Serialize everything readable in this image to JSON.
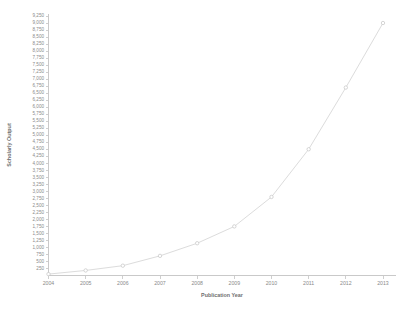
{
  "chart_data": {
    "type": "line",
    "title": "",
    "xlabel": "Publication Year",
    "ylabel": "Scholarly Output",
    "x": [
      2004,
      2005,
      2006,
      2007,
      2008,
      2009,
      2010,
      2011,
      2012,
      2013
    ],
    "categories": [
      "2004",
      "2005",
      "2006",
      "2007",
      "2008",
      "2009",
      "2010",
      "2011",
      "2012",
      "2013"
    ],
    "values": [
      50,
      180,
      350,
      700,
      1150,
      1750,
      2800,
      4500,
      6700,
      9000
    ],
    "series": [
      {
        "name": "Scholarly Output",
        "values": [
          50,
          180,
          350,
          700,
          1150,
          1750,
          2800,
          4500,
          6700,
          9000
        ]
      }
    ],
    "xlim": [
      2004,
      2013
    ],
    "ylim": [
      0,
      9250
    ],
    "ytick_step": 250,
    "grid": false,
    "legend": false,
    "marker": "circle",
    "line_color": "#dcdcdc",
    "marker_color": "#c4c4c4",
    "axis_color": "#c9c9c9",
    "label_color": "#8a8a8a",
    "yticks": [
      "9,250",
      "9,000",
      "8,750",
      "8,500",
      "8,250",
      "8,000",
      "7,750",
      "7,500",
      "7,250",
      "7,000",
      "6,750",
      "6,500",
      "6,250",
      "6,000",
      "5,750",
      "5,500",
      "5,250",
      "5,000",
      "4,750",
      "4,500",
      "4,250",
      "4,000",
      "3,750",
      "3,500",
      "3,250",
      "3,000",
      "2,750",
      "2,500",
      "2,250",
      "2,000",
      "1,750",
      "1,500",
      "1,250",
      "1,000",
      "750",
      "500",
      "250"
    ],
    "ytick_values": [
      9250,
      9000,
      8750,
      8500,
      8250,
      8000,
      7750,
      7500,
      7250,
      7000,
      6750,
      6500,
      6250,
      6000,
      5750,
      5500,
      5250,
      5000,
      4750,
      4500,
      4250,
      4000,
      3750,
      3500,
      3250,
      3000,
      2750,
      2500,
      2250,
      2000,
      1750,
      1500,
      1250,
      1000,
      750,
      500,
      250
    ]
  }
}
